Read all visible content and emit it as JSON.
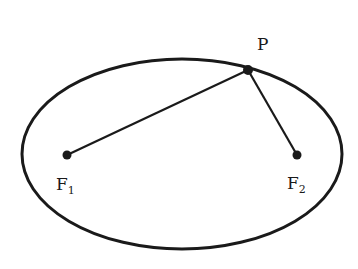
{
  "diagram": {
    "title": "",
    "points": {
      "P": {
        "label": "P",
        "x": 248,
        "y": 70
      },
      "F1": {
        "label": "F",
        "subscript": "1",
        "x": 67,
        "y": 155
      },
      "F2": {
        "label": "F",
        "subscript": "2",
        "x": 297,
        "y": 155
      }
    },
    "ellipse": {
      "cx": 182,
      "cy": 154,
      "rx": 160,
      "ry": 95
    },
    "colors": {
      "stroke": "#1a1a1a",
      "background": "#ffffff"
    }
  }
}
